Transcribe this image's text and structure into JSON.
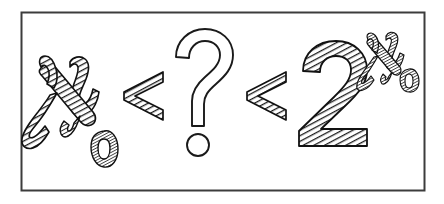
{
  "figure": {
    "expression": "ℵ0 < ? < 2^ℵ0",
    "style": "hand-drawn woodcut cross-hatched line art",
    "background_color": "#ffffff",
    "ink_color": "#1a1a1a",
    "hatch_color": "#2b2b2b",
    "frame": {
      "name": "border-frame",
      "x": 21,
      "y": 12,
      "width": 404,
      "height": 179,
      "stroke_color": "#3a3a3a",
      "stroke_width": 2,
      "fill": "#ffffff"
    },
    "symbols": [
      {
        "id": "aleph-null-left",
        "glyph": "ℵ",
        "label": "aleph",
        "subscript": "0",
        "filled": true,
        "fill_style": "diagonal-hatch",
        "role": "cardinality-of-naturals"
      },
      {
        "id": "less-than-1",
        "glyph": "<",
        "label": "less-than",
        "filled": true,
        "fill_style": "diagonal-hatch",
        "role": "relation"
      },
      {
        "id": "question-mark",
        "glyph": "?",
        "label": "question-mark",
        "filled": false,
        "fill_style": "outline",
        "role": "unknown-cardinal"
      },
      {
        "id": "less-than-2",
        "glyph": "<",
        "label": "less-than",
        "filled": true,
        "fill_style": "diagonal-hatch",
        "role": "relation"
      },
      {
        "id": "two-base",
        "glyph": "2",
        "label": "numeral-two",
        "filled": true,
        "fill_style": "diagonal-hatch",
        "role": "base-of-power"
      },
      {
        "id": "aleph-null-superscript",
        "glyph": "ℵ",
        "label": "aleph",
        "subscript": "0",
        "filled": true,
        "fill_style": "diagonal-hatch",
        "role": "exponent"
      }
    ]
  }
}
